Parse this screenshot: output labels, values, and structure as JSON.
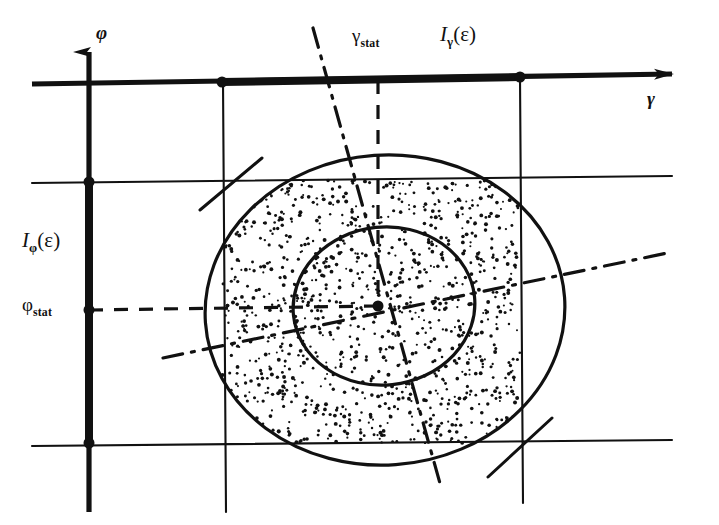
{
  "figure": {
    "kind": "scientific-line-diagram",
    "background_color": "#ffffff",
    "ink_color": "#111111",
    "width": 719,
    "height": 525
  },
  "axes": {
    "vertical": {
      "name": "axis-phi",
      "label": "φ",
      "arrow": "up",
      "x": 89,
      "y_top": 40,
      "y_bottom": 512
    },
    "horizontal": {
      "name": "axis-gamma",
      "label": "γ",
      "arrow": "right",
      "y_left": 84,
      "y_right": 74,
      "x_left": 32,
      "x_right": 690
    }
  },
  "labels": {
    "phi_axis": "φ",
    "gamma_axis": "γ",
    "gamma_stat_main": "γ",
    "gamma_stat_sub": "stat",
    "phi_stat_main": "φ",
    "phi_stat_sub": "stat",
    "interval_gamma_prefix": "I",
    "interval_gamma_sub": "γ",
    "interval_gamma_arg": "(ε)",
    "interval_phi_prefix": "I",
    "interval_phi_sub": "φ",
    "interval_phi_arg": "(ε)"
  },
  "markers": {
    "points": [
      {
        "name": "gamma-lower-bound-point",
        "x": 222,
        "y": 82
      },
      {
        "name": "gamma-upper-bound-point",
        "x": 520,
        "y": 77
      },
      {
        "name": "phi-upper-bound-point",
        "x": 89,
        "y": 182
      },
      {
        "name": "phi-stat-point",
        "x": 89,
        "y": 310
      },
      {
        "name": "phi-lower-bound-point",
        "x": 89,
        "y": 443
      },
      {
        "name": "distribution-center-point",
        "x": 378,
        "y": 306
      }
    ],
    "radius": 5.5
  },
  "tolerance_box": {
    "name": "tolerance-rectangle",
    "x_left": 222,
    "x_right": 520,
    "y_top": 180,
    "y_bottom": 443,
    "fill": "stipple"
  },
  "ellipses": {
    "outer": {
      "name": "outer-contour",
      "cx": 385,
      "cy": 310,
      "rx": 180,
      "ry": 155,
      "rotation": -4
    },
    "inner": {
      "name": "inner-contour",
      "cx": 384,
      "cy": 306,
      "rx": 91,
      "ry": 79,
      "rotation": -6
    }
  },
  "principal_axes": {
    "major": {
      "name": "major-principal-axis",
      "x1": 163,
      "y1": 358,
      "x2": 672,
      "y2": 252
    },
    "minor": {
      "name": "minor-principal-axis",
      "x1": 313,
      "y1": 28,
      "x2": 441,
      "y2": 487
    }
  },
  "leader_lines": {
    "gamma_stat_leader": {
      "name": "gamma-stat-dashed-leader",
      "x1": 378,
      "y1": 80,
      "x2": 378,
      "y2": 306
    },
    "phi_stat_leader": {
      "name": "phi-stat-dashed-leader",
      "x1": 89,
      "y1": 310,
      "x2": 378,
      "y2": 306
    }
  },
  "corner_ticks": [
    {
      "name": "corner-tick-top-left",
      "x1": 200,
      "y1": 210,
      "x2": 262,
      "y2": 158
    },
    {
      "name": "corner-tick-bottom-right",
      "x1": 488,
      "y1": 477,
      "x2": 552,
      "y2": 418
    }
  ],
  "label_positions": {
    "phi_axis": {
      "x": 96,
      "y": 22
    },
    "gamma_axis": {
      "x": 647,
      "y": 88
    },
    "gamma_stat": {
      "x": 352,
      "y": 25
    },
    "interval_gamma": {
      "x": 440,
      "y": 22
    },
    "interval_phi": {
      "x": 22,
      "y": 228
    },
    "phi_stat": {
      "x": 22,
      "y": 294
    }
  },
  "stipple": {
    "description": "random dot fill inside tolerance rectangle clipped to outer contour",
    "dot_count": 1150,
    "dot_radius_min": 1.0,
    "dot_radius_max": 2.0,
    "seed": 20240517
  }
}
